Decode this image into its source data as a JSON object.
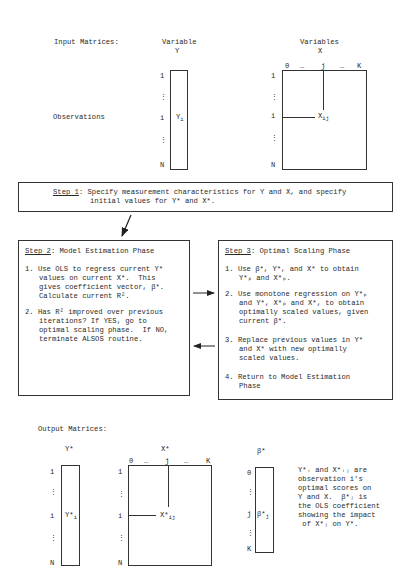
{
  "input": {
    "section_label": "Input Matrices:",
    "row_label": "Observations",
    "y_matrix": {
      "header1": "Variable",
      "header2": "Y",
      "rows": [
        "1",
        "⋮",
        "i",
        "⋮",
        "N"
      ],
      "cell": "Y",
      "cell_sub": "i"
    },
    "x_matrix": {
      "header1": "Variables",
      "header2": "X",
      "cols": [
        "0",
        "…",
        "j",
        "…",
        "K"
      ],
      "rows": [
        "1",
        "⋮",
        "i",
        "⋮",
        "N"
      ],
      "cell": "X",
      "cell_sub": "ij"
    }
  },
  "step1": {
    "label": "Step 1",
    "text1": ": Specify measurement characteristics for Y and X, and specify",
    "text2": "initial values for Y* and X*."
  },
  "step2": {
    "label": "Step 2",
    "title": ": Model Estimation Phase",
    "items": [
      {
        "num": "1.",
        "lines": [
          "Use OLS to regress current Y*",
          "values on current X*.  This",
          "gives coefficient vector, β*.",
          "Calculate current R²."
        ]
      },
      {
        "num": "2.",
        "lines": [
          "Has R² improved over previous",
          "iterations? If YES, go to",
          "optimal scaling phase.  If NO,",
          "terminate ALSOS routine."
        ]
      }
    ],
    "yes": "YES",
    "no": "NO"
  },
  "step3": {
    "label": "Step 3",
    "title": ": Optimal Scaling Phase",
    "items": [
      {
        "num": "1.",
        "lines": [
          "Use β*, Y*, and X* to obtain",
          "Y*ₚ and X*ₚ."
        ]
      },
      {
        "num": "2.",
        "lines": [
          "Use monotone regression on Y*ₚ",
          "and Y*, X*ₚ and X*, to obtain",
          "optimally scaled values, given",
          "current β*."
        ]
      },
      {
        "num": "3.",
        "lines": [
          "Replace previous values in Y*",
          "and X* with new optimally",
          "scaled values."
        ]
      },
      {
        "num": "4.",
        "lines": [
          "Return to Model Estimation",
          "Phase"
        ]
      }
    ]
  },
  "output": {
    "section_label": "Output Matrices:",
    "y_star": {
      "header": "Y*",
      "rows": [
        "1",
        "⋮",
        "i",
        "⋮",
        "N"
      ],
      "cell": "Y*",
      "cell_sub": "i"
    },
    "x_star": {
      "header": "X*",
      "cols": [
        "0",
        "…",
        "j",
        "…",
        "K"
      ],
      "rows": [
        "1",
        "⋮",
        "i",
        "⋮",
        "N"
      ],
      "cell": "X*",
      "cell_sub": "ij"
    },
    "beta_star": {
      "header": "β*",
      "rows": [
        "0",
        "⋮",
        "j",
        "⋮",
        "K"
      ],
      "cell": "β*",
      "cell_sub": "j"
    },
    "note_lines": [
      "Y*ᵢ and X*ᵢⱼ are",
      "observation i's",
      "optimal scores on",
      "Y and X.  β*ⱼ is",
      "the OLS coefficient",
      "showing the impact",
      " of X*ⱼ on Y*."
    ]
  }
}
